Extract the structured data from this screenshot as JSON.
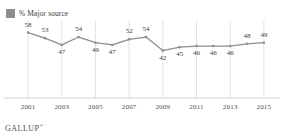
{
  "legend": {
    "label": "% Major source",
    "swatch_color": "#8e8e8e"
  },
  "source": {
    "name": "GALLUP",
    "trademark": "®"
  },
  "style": {
    "line_color": "#8e8e8e",
    "marker_color": "#8e8e8e",
    "gridline_color": "#d9d9d9",
    "axis_color": "#c9c9c9",
    "label_color": "#3c3c3c",
    "background": "#ffffff"
  },
  "chart_data": {
    "type": "line",
    "title": "",
    "subtitle": "",
    "xlabel": "",
    "ylabel": "",
    "grid": "vertical",
    "legend_position": "top-left",
    "x": [
      2001,
      2002,
      2003,
      2004,
      2005,
      2006,
      2007,
      2008,
      2009,
      2010,
      2011,
      2012,
      2013,
      2014,
      2015
    ],
    "categories": [
      "2001",
      "2002",
      "2003",
      "2004",
      "2005",
      "2006",
      "2007",
      "2008",
      "2009",
      "2010",
      "2011",
      "2012",
      "2013",
      "2014",
      "2015"
    ],
    "values": [
      58,
      53,
      47,
      54,
      49,
      47,
      52,
      54,
      42,
      45,
      46,
      46,
      46,
      48,
      49
    ],
    "series": [
      {
        "name": "% Major source",
        "values": [
          58,
          53,
          47,
          54,
          49,
          47,
          52,
          54,
          42,
          45,
          46,
          46,
          46,
          48,
          49
        ]
      }
    ],
    "data_labels": [
      "58",
      "53",
      "47",
      "54",
      "49",
      "47",
      "52",
      "54",
      "42",
      "45",
      "46",
      "46",
      "46",
      "48",
      "49"
    ],
    "label_positions": [
      "above",
      "above",
      "below",
      "above",
      "below",
      "below",
      "above",
      "above",
      "below",
      "below",
      "below",
      "below",
      "below",
      "above",
      "above"
    ],
    "xticks": [
      2001,
      2003,
      2005,
      2007,
      2009,
      2011,
      2013,
      2015
    ],
    "xticklabels": [
      "2001",
      "2003",
      "2005",
      "2007",
      "2009",
      "2011",
      "2013",
      "2015"
    ],
    "xlim": [
      2000.4,
      2015.6
    ],
    "ylim": [
      0,
      62
    ],
    "gridline_years": [
      2001,
      2003,
      2005,
      2007,
      2009,
      2011,
      2013,
      2015
    ]
  }
}
